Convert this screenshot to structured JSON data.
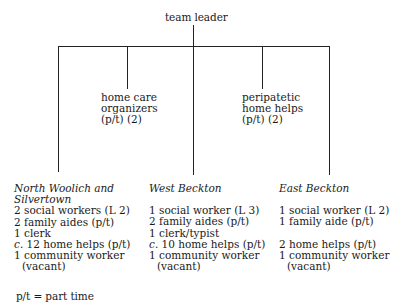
{
  "diagram": {
    "root": {
      "label": "team leader"
    },
    "middle_nodes": [
      {
        "label_lines": [
          "home care",
          "organizers",
          "(p/t) (2)"
        ]
      },
      {
        "label_lines": [
          "peripatetic",
          "home helps",
          "(p/t) (2)"
        ]
      }
    ],
    "areas": [
      {
        "name_lines": [
          "North Woolich and",
          "Silvertown"
        ],
        "staff": [
          {
            "text": "2 social workers (L 2)"
          },
          {
            "text": "2 family aides (p/t)"
          },
          {
            "text": "1 clerk"
          },
          {
            "prefix": "c.",
            "text": " 12 home helps (p/t)"
          },
          {
            "text": "1 community worker"
          },
          {
            "text": "(vacant)",
            "indent": true
          }
        ]
      },
      {
        "name_lines": [
          "West Beckton"
        ],
        "staff": [
          {
            "text": "1 social worker (L 3)"
          },
          {
            "text": "2 family aides (p/t)"
          },
          {
            "text": "1 clerk/typist"
          },
          {
            "prefix": "c.",
            "text": " 10 home helps (p/t)"
          },
          {
            "text": "1 community worker"
          },
          {
            "text": "(vacant)",
            "indent": true
          }
        ]
      },
      {
        "name_lines": [
          "East Beckton"
        ],
        "staff": [
          {
            "text": "1 social worker (L 2)"
          },
          {
            "text": "1 family aide (p/t)"
          },
          {
            "text": "2 home helps (p/t)"
          },
          {
            "text": "1 community worker"
          },
          {
            "text": "(vacant)",
            "indent": true
          }
        ]
      }
    ],
    "legend": "p/t = part time"
  }
}
